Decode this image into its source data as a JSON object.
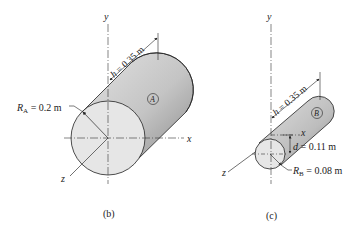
{
  "figures": [
    {
      "id": "b",
      "caption": "(b)",
      "body_label": "A",
      "radius_label": {
        "symbol": "R",
        "sub": "A",
        "text": " = 0.2 m"
      },
      "length_label": {
        "symbol": "h",
        "text": " = 0.35 m"
      },
      "axes": {
        "x": "x",
        "y": "y",
        "z": "z"
      }
    },
    {
      "id": "c",
      "caption": "(c)",
      "body_label": "B",
      "radius_label": {
        "symbol": "R",
        "sub": "B",
        "text": " = 0.08 m"
      },
      "length_label": {
        "symbol": "h",
        "text": " = 0.35 m"
      },
      "offset_label": {
        "symbol": "d",
        "text": " = 0.11 m"
      },
      "axes": {
        "x": "x",
        "y": "y",
        "z": "z"
      }
    }
  ],
  "colors": {
    "cylinder_side_light": "#d9d9d9",
    "cylinder_side_dark": "#8f8f8f",
    "cylinder_face": "#e6e6e6",
    "line": "#222222"
  }
}
